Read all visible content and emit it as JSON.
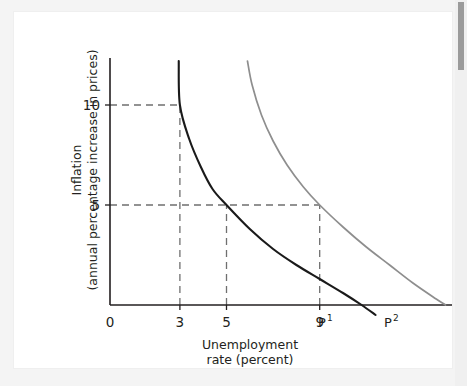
{
  "figure": {
    "background_color": "#f4f4f4",
    "plate_color": "#ffffff"
  },
  "scrollbar": {
    "name": "vertical-scrollbar",
    "thumb_color": "#9b9b9b",
    "track_color": "#f0f0f0"
  },
  "chart_data": {
    "type": "line",
    "title": "",
    "subtitle": "",
    "xlabel_line1": "Unemployment",
    "xlabel_line2": "rate (percent)",
    "ylabel_line1": "Inflation",
    "ylabel_line2": "(annual percentage increase in prices)",
    "xlim": [
      0,
      14
    ],
    "ylim": [
      0,
      13
    ],
    "grid": false,
    "legend_position": "inline-endpoint-labels",
    "x_ticks": [
      {
        "value": 0,
        "label": "0"
      },
      {
        "value": 3,
        "label": "3"
      },
      {
        "value": 5,
        "label": "5"
      },
      {
        "value": 9,
        "label": "9"
      }
    ],
    "y_ticks": [
      {
        "value": 5,
        "label": "5"
      },
      {
        "value": 10,
        "label": "10"
      }
    ],
    "series": [
      {
        "name": "P1",
        "label_base": "P",
        "label_sup": "1",
        "color": "#1a1a1a",
        "style": "solid",
        "points": [
          {
            "x": 2.95,
            "y": 12.2
          },
          {
            "x": 3.0,
            "y": 10.0
          },
          {
            "x": 3.4,
            "y": 8.3
          },
          {
            "x": 3.9,
            "y": 6.9
          },
          {
            "x": 4.4,
            "y": 5.8
          },
          {
            "x": 5.0,
            "y": 5.0
          },
          {
            "x": 6.0,
            "y": 3.8
          },
          {
            "x": 7.0,
            "y": 2.8
          },
          {
            "x": 8.0,
            "y": 2.0
          },
          {
            "x": 9.0,
            "y": 1.3
          },
          {
            "x": 10.0,
            "y": 0.6
          },
          {
            "x": 10.8,
            "y": 0.0
          },
          {
            "x": 11.4,
            "y": -0.5
          }
        ]
      },
      {
        "name": "P2",
        "label_base": "P",
        "label_sup": "2",
        "color": "#8e8e8e",
        "style": "solid",
        "points": [
          {
            "x": 5.9,
            "y": 12.2
          },
          {
            "x": 6.1,
            "y": 11.0
          },
          {
            "x": 6.5,
            "y": 9.5
          },
          {
            "x": 7.0,
            "y": 8.2
          },
          {
            "x": 7.6,
            "y": 7.0
          },
          {
            "x": 8.3,
            "y": 5.9
          },
          {
            "x": 9.0,
            "y": 5.0
          },
          {
            "x": 10.0,
            "y": 3.9
          },
          {
            "x": 11.0,
            "y": 2.9
          },
          {
            "x": 12.0,
            "y": 2.0
          },
          {
            "x": 13.0,
            "y": 1.1
          },
          {
            "x": 14.0,
            "y": 0.3
          },
          {
            "x": 14.4,
            "y": 0.0
          }
        ]
      }
    ],
    "annotations": [
      {
        "name": "guide-10-to-p1",
        "type": "dashed-horizontal",
        "y": 10,
        "x_from": 0,
        "x_to": 3
      },
      {
        "name": "guide-u3",
        "type": "dashed-vertical",
        "x": 3,
        "y_from": 0,
        "y_to": 10
      },
      {
        "name": "guide-5-to-p2",
        "type": "dashed-horizontal",
        "y": 5,
        "x_from": 0,
        "x_to": 9
      },
      {
        "name": "guide-u5",
        "type": "dashed-vertical",
        "x": 5,
        "y_from": 0,
        "y_to": 5
      },
      {
        "name": "guide-u9",
        "type": "dashed-vertical",
        "x": 9,
        "y_from": 0,
        "y_to": 5
      }
    ]
  }
}
